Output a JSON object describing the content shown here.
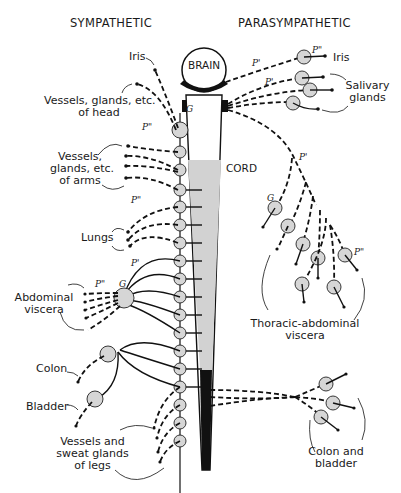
{
  "headers": {
    "left": "SYMPATHETIC",
    "right": "PARASYMPATHETIC"
  },
  "cns": {
    "brain_label": "BRAIN",
    "cord_label": "CORD"
  },
  "sympathetic_labels": {
    "iris": "Iris",
    "head_line1": "Vessels, glands, etc.",
    "head_line2": "of head",
    "arms_line1": "Vessels,",
    "arms_line2": "glands, etc.",
    "arms_line3": "of arms",
    "lungs": "Lungs",
    "abdominal_line1": "Abdominal",
    "abdominal_line2": "viscera",
    "colon": "Colon",
    "bladder": "Bladder",
    "legs_line1": "Vessels and",
    "legs_line2": "sweat glands",
    "legs_line3": "of legs"
  },
  "parasympathetic_labels": {
    "iris": "Iris",
    "salivary_line1": "Salivary",
    "salivary_line2": "glands",
    "thoracic_line1": "Thoracic-abdominal",
    "thoracic_line2": "viscera",
    "colon_line1": "Colon and",
    "colon_line2": "bladder"
  },
  "fiber_markers": {
    "preganglionic": "P'",
    "postganglionic": "P\"",
    "ganglion": "G"
  }
}
